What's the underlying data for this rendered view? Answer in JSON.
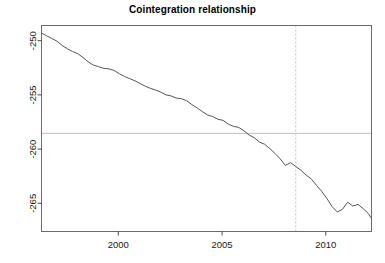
{
  "chart_data": {
    "type": "line",
    "title": "Cointegration relationship",
    "xlabel": "",
    "ylabel": "",
    "xlim": [
      1996.3,
      2012.2
    ],
    "ylim": [
      -267.6,
      -248.6
    ],
    "grid": false,
    "legend": null,
    "xticks": [
      2000,
      2005,
      2010
    ],
    "xtick_labels": [
      "2000",
      "2005",
      "2010"
    ],
    "yticks": [
      -250,
      -255,
      -260,
      -265
    ],
    "ytick_labels": [
      "-250",
      "-255",
      "-260",
      "-265"
    ],
    "annotations": [
      {
        "name": "mean-level-line",
        "type": "hline",
        "y": -258.55,
        "color": "#bfbfbf",
        "style": "solid"
      },
      {
        "name": "break-date-line",
        "type": "vline",
        "x": 2008.55,
        "color": "#c4c4c4",
        "style": "dashed"
      }
    ],
    "series": [
      {
        "name": "cointegration residual",
        "color": "#555555",
        "x": [
          1996.3,
          1996.55,
          1996.8,
          1997.05,
          1997.3,
          1997.55,
          1997.8,
          1998.05,
          1998.3,
          1998.55,
          1998.8,
          1999.05,
          1999.3,
          1999.55,
          1999.8,
          2000.05,
          2000.3,
          2000.55,
          2000.8,
          2001.05,
          2001.3,
          2001.55,
          2001.8,
          2002.05,
          2002.3,
          2002.55,
          2002.8,
          2003.05,
          2003.3,
          2003.55,
          2003.8,
          2004.05,
          2004.3,
          2004.55,
          2004.8,
          2005.05,
          2005.3,
          2005.55,
          2005.8,
          2006.05,
          2006.3,
          2006.55,
          2006.8,
          2007.05,
          2007.3,
          2007.55,
          2007.8,
          2008.05,
          2008.3,
          2008.55,
          2008.8,
          2009.05,
          2009.3,
          2009.55,
          2009.8,
          2010.05,
          2010.3,
          2010.55,
          2010.8,
          2011.05,
          2011.3,
          2011.55,
          2011.8,
          2012.05,
          2012.2
        ],
        "y": [
          -249.3,
          -249.55,
          -249.8,
          -250.05,
          -250.45,
          -250.75,
          -251.0,
          -251.2,
          -251.55,
          -251.95,
          -252.25,
          -252.4,
          -252.55,
          -252.6,
          -252.75,
          -253.05,
          -253.3,
          -253.5,
          -253.7,
          -253.95,
          -254.2,
          -254.4,
          -254.55,
          -254.75,
          -255.0,
          -255.1,
          -255.3,
          -255.35,
          -255.55,
          -255.9,
          -256.2,
          -256.55,
          -256.85,
          -257.0,
          -257.25,
          -257.35,
          -257.7,
          -257.9,
          -258.0,
          -258.3,
          -258.7,
          -258.95,
          -259.35,
          -259.55,
          -259.95,
          -260.4,
          -260.9,
          -261.5,
          -261.25,
          -261.6,
          -261.95,
          -262.4,
          -262.75,
          -263.35,
          -263.9,
          -264.55,
          -265.3,
          -265.8,
          -265.55,
          -264.9,
          -265.25,
          -265.1,
          -265.5,
          -265.95,
          -266.4
        ]
      }
    ]
  }
}
